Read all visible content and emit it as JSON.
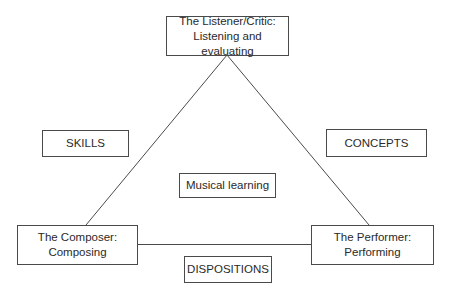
{
  "diagram": {
    "type": "triangle-model",
    "nodes": {
      "listener": {
        "line1": "The Listener/Critic:",
        "line2": "Listening and evaluating",
        "position": "top-vertex"
      },
      "composer": {
        "line1": "The Composer:",
        "line2": "Composing",
        "position": "bottom-left-vertex"
      },
      "performer": {
        "line1": "The Performer:",
        "line2": "Performing",
        "position": "bottom-right-vertex"
      },
      "skills": {
        "label": "SKILLS",
        "position": "left-side"
      },
      "concepts": {
        "label": "CONCEPTS",
        "position": "right-side"
      },
      "musical_learning": {
        "label": "Musical learning",
        "position": "center"
      },
      "dispositions": {
        "label": "DISPOSITIONS",
        "position": "bottom-side"
      }
    },
    "edges": [
      {
        "from": "listener",
        "to": "composer"
      },
      {
        "from": "listener",
        "to": "performer"
      },
      {
        "from": "composer",
        "to": "performer"
      }
    ],
    "colors": {
      "line": "#4a4a4a",
      "text": "#2a2a2a",
      "background": "#ffffff"
    }
  }
}
